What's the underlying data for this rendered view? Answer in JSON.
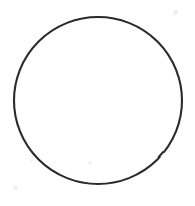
{
  "canvas": {
    "width": 195,
    "height": 206,
    "background_color": "#ffffff",
    "alt_text": "Hand-drawn circle outline on a plain white background"
  },
  "figure": {
    "name": "circle-outline",
    "shape": "circle",
    "center_x": 98,
    "center_y": 100.5,
    "radius_x": 84,
    "radius_y": 83.5,
    "stroke_color": "#2b2b2b",
    "stroke_width": 2.1,
    "fill_color": "none",
    "bounds": {
      "left": 14,
      "top": 17,
      "right": 182,
      "bottom": 184
    },
    "style_note": "irregular scanned ink outline, slightly thicker near top and bottom"
  },
  "specks": [
    {
      "name": "speck-top-right",
      "x": 175,
      "y": 12,
      "size": 5,
      "color": "#f0f0f0"
    },
    {
      "name": "speck-bottom-center",
      "x": 90,
      "y": 163,
      "size": 4,
      "color": "#f2f2f2"
    },
    {
      "name": "speck-bottom-left",
      "x": 15,
      "y": 187,
      "size": 5,
      "color": "#f1f1f1"
    },
    {
      "name": "speck-left-lower",
      "x": 31,
      "y": 160,
      "size": 3,
      "color": "#f4f4f4"
    }
  ]
}
